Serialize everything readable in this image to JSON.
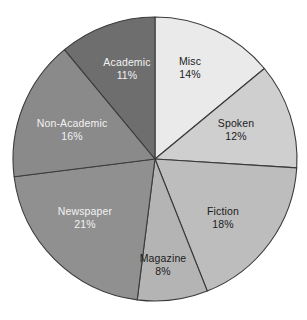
{
  "chart_data": {
    "type": "pie",
    "title": "",
    "subtitle": "",
    "xlabel": "",
    "ylabel": "",
    "grid": false,
    "legend": "none",
    "labels_inside_slices": true,
    "start_angle_deg": 0,
    "direction": "clockwise",
    "total_percent": 100,
    "categories": [
      "Misc",
      "Spoken",
      "Fiction",
      "Magazine",
      "Newspaper",
      "Non-Academic",
      "Academic"
    ],
    "values": [
      14,
      12,
      18,
      8,
      21,
      16,
      11
    ],
    "value_labels": [
      "14%",
      "12%",
      "18%",
      "8%",
      "21%",
      "16%",
      "11%"
    ],
    "slices": [
      {
        "name": "Misc",
        "value": 14,
        "value_label": "14%",
        "color": "#eaeaea",
        "text_color": "#1c1c1c",
        "label_x": 190,
        "label_y": 68
      },
      {
        "name": "Spoken",
        "value": 12,
        "value_label": "12%",
        "color": "#cfcfcf",
        "text_color": "#1c1c1c",
        "label_x": 236,
        "label_y": 130
      },
      {
        "name": "Fiction",
        "value": 18,
        "value_label": "18%",
        "color": "#bdbdbd",
        "text_color": "#1c1c1c",
        "label_x": 223,
        "label_y": 218
      },
      {
        "name": "Magazine",
        "value": 8,
        "value_label": "8%",
        "color": "#b4b4b4",
        "text_color": "#1c1c1c",
        "label_x": 163,
        "label_y": 265
      },
      {
        "name": "Newspaper",
        "value": 21,
        "value_label": "21%",
        "color": "#909090",
        "text_color": "#f2f2f2",
        "label_x": 85,
        "label_y": 218
      },
      {
        "name": "Non-Academic",
        "value": 16,
        "value_label": "16%",
        "color": "#8a8a8a",
        "text_color": "#f2f2f2",
        "label_x": 72,
        "label_y": 130
      },
      {
        "name": "Academic",
        "value": 11,
        "value_label": "11%",
        "color": "#6e6e6e",
        "text_color": "#f2f2f2",
        "label_x": 127,
        "label_y": 69
      }
    ],
    "geometry": {
      "center_x": 155,
      "center_y": 159,
      "radius": 142
    },
    "stroke_color": "#3b3b3b",
    "background_color": "#ffffff"
  }
}
